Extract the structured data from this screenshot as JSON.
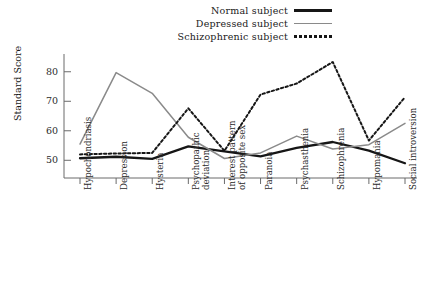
{
  "legend": {
    "items": [
      {
        "label": "Normal subject",
        "style": "solid-thick",
        "color": "#161616"
      },
      {
        "label": "Depressed subject",
        "style": "solid-thin",
        "color": "#8a8a8a"
      },
      {
        "label": "Schizophrenic subject",
        "style": "dotted",
        "color": "#161616"
      }
    ]
  },
  "axes": {
    "ylabel": "Standard Score",
    "yticks": [
      "50",
      "60",
      "70",
      "80"
    ]
  },
  "chart_data": {
    "type": "line",
    "title": "",
    "xlabel": "",
    "ylabel": "Standard Score",
    "ylim": [
      44,
      85
    ],
    "yticks": [
      50,
      60,
      70,
      80
    ],
    "grid": false,
    "legend_position": "top-center",
    "categories": [
      "Hypochondriasis",
      "Depression",
      "Hysteria",
      "Psychopathic deviation",
      "Interest pattern of opposite sex",
      "Paranoia",
      "Psychasthenia",
      "Schizophrenia",
      "Hypomania",
      "Social introversion"
    ],
    "series": [
      {
        "name": "Normal subject",
        "style": "solid-thick",
        "color": "#161616",
        "values": [
          50.7,
          51.2,
          50.5,
          54.7,
          53.0,
          51.3,
          54.2,
          56.2,
          53.3,
          49.0
        ]
      },
      {
        "name": "Depressed subject",
        "style": "solid-thin",
        "color": "#8a8a8a",
        "values": [
          55.5,
          79.7,
          72.7,
          57.8,
          50.6,
          52.5,
          58.2,
          53.8,
          55.3,
          62.5
        ]
      },
      {
        "name": "Schizophrenic subject",
        "style": "dotted",
        "color": "#161616",
        "values": [
          52.0,
          52.3,
          52.5,
          67.6,
          53.2,
          72.3,
          76.0,
          83.3,
          56.7,
          71.4
        ]
      }
    ]
  }
}
